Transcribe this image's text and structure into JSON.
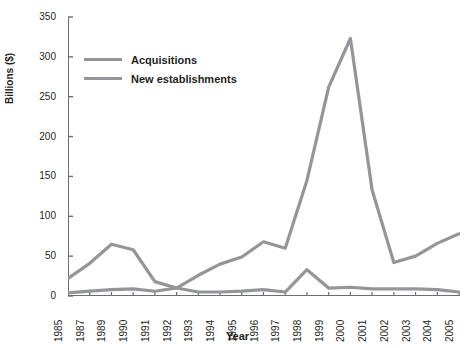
{
  "chart_data": {
    "type": "line",
    "title": "",
    "xlabel": "Year",
    "ylabel": "Billions ($)",
    "ylim": [
      0,
      350
    ],
    "yticks": [
      0,
      50,
      100,
      150,
      200,
      250,
      300,
      350
    ],
    "grid": false,
    "legend_position": "top-left",
    "categories": [
      "1985",
      "1987",
      "1989",
      "1990",
      "1991",
      "1992",
      "1993",
      "1994",
      "1995",
      "1996",
      "1997",
      "1998",
      "1999",
      "2000",
      "2001",
      "2002",
      "2003",
      "2004",
      "2005"
    ],
    "series": [
      {
        "name": "Acquisitions",
        "color": "#939598",
        "values": [
          22,
          41,
          65,
          58,
          18,
          10,
          26,
          40,
          49,
          68,
          60,
          145,
          262,
          323,
          133,
          42,
          50,
          66,
          78
        ]
      },
      {
        "name": "New establishments",
        "color": "#939598",
        "values": [
          4,
          6,
          8,
          9,
          6,
          10,
          5,
          5,
          6,
          8,
          5,
          33,
          10,
          11,
          9,
          9,
          9,
          8,
          5
        ]
      }
    ]
  },
  "axes": {
    "y_label": "Billions ($)",
    "x_label": "Year",
    "y_tick_labels": [
      "350",
      "300",
      "250",
      "200",
      "150",
      "100",
      "50",
      "0"
    ],
    "x_tick_labels": [
      "1985",
      "1987",
      "1989",
      "1990",
      "1991",
      "1992",
      "1993",
      "1994",
      "1995",
      "1996",
      "1997",
      "1998",
      "1999",
      "2000",
      "2001",
      "2002",
      "2003",
      "2004",
      "2005"
    ]
  },
  "legend": {
    "items": [
      {
        "label": "Acquisitions",
        "color": "#939598"
      },
      {
        "label": "New establishments",
        "color": "#939598"
      }
    ]
  },
  "colors": {
    "line": "#939598",
    "axis": "#6d6e71",
    "text": "#231f20",
    "background": "#ffffff"
  }
}
